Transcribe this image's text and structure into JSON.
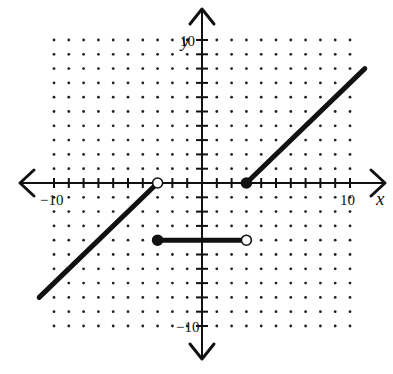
{
  "header": {
    "cropped_text": "…p…"
  },
  "chart_data": {
    "type": "line",
    "title": "",
    "xlabel": "x",
    "ylabel": "y",
    "xlim": [
      -10,
      10
    ],
    "ylim": [
      -10,
      10
    ],
    "grid": "dots at every integer",
    "tick_labels": {
      "x": [
        {
          "value": -10,
          "label": "-10"
        },
        {
          "value": 10,
          "label": "10"
        }
      ],
      "y": [
        {
          "value": 10,
          "label": "10"
        },
        {
          "value": -10,
          "label": "-10"
        }
      ]
    },
    "series": [
      {
        "name": "left ray",
        "points": [
          [
            -11,
            -8
          ],
          [
            -3,
            0
          ]
        ],
        "endpoints": [
          {
            "x": -3,
            "y": 0,
            "type": "open"
          }
        ],
        "extends": "arrowless beyond grid to lower-left"
      },
      {
        "name": "middle segment",
        "points": [
          [
            -3,
            -4
          ],
          [
            3,
            -4
          ]
        ],
        "endpoints": [
          {
            "x": -3,
            "y": -4,
            "type": "closed"
          },
          {
            "x": 3,
            "y": -4,
            "type": "open"
          }
        ]
      },
      {
        "name": "right ray",
        "points": [
          [
            3,
            0
          ],
          [
            11,
            8
          ]
        ],
        "endpoints": [
          {
            "x": 3,
            "y": 0,
            "type": "closed"
          }
        ],
        "extends": "arrowless beyond grid to upper-right"
      }
    ],
    "piecewise_definition": [
      {
        "domain": "x < -3",
        "rule": "y = x + 3"
      },
      {
        "domain": "-3 <= x < 3",
        "rule": "y = -4"
      },
      {
        "domain": "x >= 3",
        "rule": "y = x - 3"
      }
    ]
  },
  "geometry": {
    "origin_px": [
      202,
      183
    ],
    "unit_x_px": 14.8,
    "unit_y_px": 14.3
  },
  "labels": {
    "x_axis": "x",
    "y_axis": "y",
    "x_min": "-10",
    "x_max": "10",
    "y_max": "10",
    "y_min": "-10"
  },
  "colors": {
    "ink": "#111111",
    "dot": "#222222",
    "background": "#ffffff"
  }
}
